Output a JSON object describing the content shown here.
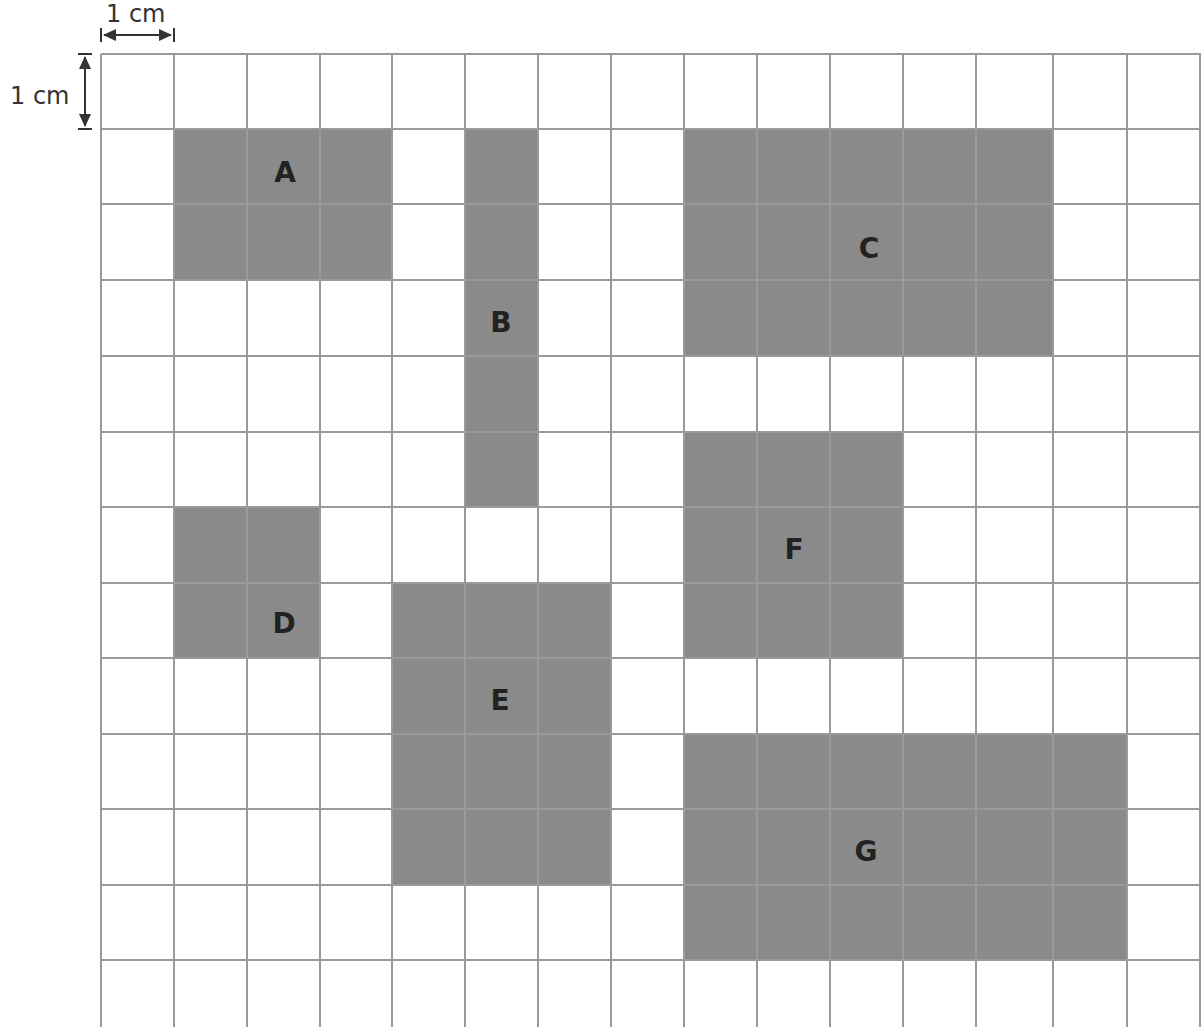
{
  "diagram": {
    "type": "grid-area-diagram",
    "scale": {
      "horizontal_label": "1 cm",
      "vertical_label": "1 cm"
    },
    "grid": {
      "columns": 15,
      "rows_full": 12,
      "has_partial_bottom_row": true,
      "x_lines": [
        101,
        174,
        247,
        320,
        392,
        465,
        538,
        611,
        684,
        757,
        830,
        903,
        976,
        1053,
        1127,
        1200
      ],
      "y_lines": [
        54,
        129,
        204,
        280,
        356,
        432,
        507,
        583,
        658,
        734,
        809,
        885,
        960
      ],
      "bottom_edge": 1027,
      "line_color": "#9a9a9a"
    },
    "shape_color": "#8a8a8a",
    "label_color": "#222222",
    "shapes": [
      {
        "label": "A",
        "col": 1,
        "row": 1,
        "width_cells": 3,
        "height_cells": 2,
        "label_x": 285,
        "label_y": 172
      },
      {
        "label": "B",
        "col": 5,
        "row": 1,
        "width_cells": 1,
        "height_cells": 5,
        "label_x": 501,
        "label_y": 322
      },
      {
        "label": "C",
        "col": 8,
        "row": 1,
        "width_cells": 5,
        "height_cells": 3,
        "label_x": 869,
        "label_y": 248
      },
      {
        "label": "D",
        "col": 1,
        "row": 6,
        "width_cells": 2,
        "height_cells": 2,
        "label_x": 284,
        "label_y": 623
      },
      {
        "label": "E",
        "col": 4,
        "row": 7,
        "width_cells": 3,
        "height_cells": 4,
        "label_x": 500,
        "label_y": 700
      },
      {
        "label": "F",
        "col": 8,
        "row": 5,
        "width_cells": 3,
        "height_cells": 3,
        "label_x": 794,
        "label_y": 549
      },
      {
        "label": "G",
        "col": 8,
        "row": 9,
        "width_cells": 6,
        "height_cells": 3,
        "label_x": 866,
        "label_y": 851
      }
    ]
  }
}
